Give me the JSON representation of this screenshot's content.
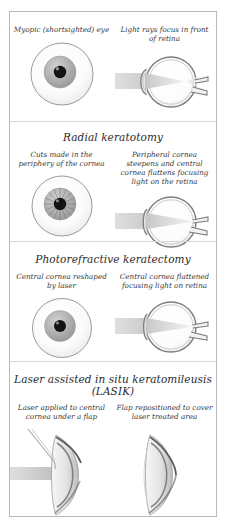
{
  "figure": {
    "background_color": "#ffffff",
    "border_color": "#b9b9b9",
    "ink_color": "#3a3a3a"
  },
  "sections": [
    {
      "id": "myopia",
      "heading": "",
      "left": {
        "caption": "Myopic (shortsighted) eye",
        "view": "front-eye",
        "icon": "eye-front-icon"
      },
      "right": {
        "caption": "Light rays focus in front of retina",
        "view": "side-eye",
        "icon": "eye-cross-section-icon",
        "focus": "in-front-of-retina"
      }
    },
    {
      "id": "radial-keratotomy",
      "heading": "Radial keratotomy",
      "left": {
        "caption": "Cuts made in the periphery of the cornea",
        "view": "front-eye",
        "icon": "eye-front-radial-cuts-icon",
        "radial_cuts": 16
      },
      "right": {
        "caption": "Peripheral cornea steepens and central cornea flattens focusing light on the retina",
        "view": "side-eye",
        "icon": "eye-cross-section-icon",
        "focus": "on-retina"
      }
    },
    {
      "id": "photorefractive-keratectomy",
      "heading": "Photorefractive keratectomy",
      "left": {
        "caption": "Central cornea reshaped by laser",
        "view": "front-eye",
        "icon": "eye-front-icon"
      },
      "right": {
        "caption": "Central cornea flattened focusing light on retina",
        "view": "side-eye",
        "icon": "eye-cross-section-icon",
        "focus": "on-retina"
      }
    },
    {
      "id": "lasik",
      "heading": "Laser assisted in situ keratomileusis",
      "heading_line2": "(LASIK)",
      "left": {
        "caption": "Laser applied to central cornea under a flap",
        "view": "cornea-profile",
        "icon": "cornea-flap-open-icon"
      },
      "right": {
        "caption": "Flap repositioned to cover laser treated area",
        "view": "cornea-profile",
        "icon": "cornea-flap-closed-icon"
      }
    }
  ]
}
